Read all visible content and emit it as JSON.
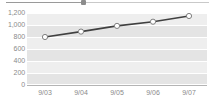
{
  "widget": {
    "title": "",
    "top_slider": {
      "name": "horizontal-scrollbar",
      "thumb_position_pct": 38
    }
  },
  "colors": {
    "plot_background": "#eeeeee",
    "band": "#e4e4e4",
    "gridline": "#ffffff",
    "axis": "#b4b4b4",
    "tick_label": "#8a8a8a",
    "series_line": "#404040",
    "marker_fill": "#ffffff",
    "marker_stroke": "#808080"
  },
  "chart_data": {
    "type": "line",
    "title": "",
    "subtitle": "",
    "xlabel": "",
    "ylabel": "",
    "categories": [
      "9/03",
      "9/04",
      "9/05",
      "9/06",
      "9/07"
    ],
    "series": [
      {
        "name": "Series 1",
        "values": [
          800,
          890,
          985,
          1055,
          1150
        ]
      }
    ],
    "ylim": [
      0,
      1200
    ],
    "ytick_step": 200,
    "ytick_labels": [
      "1,200",
      "1,000",
      "800",
      "600",
      "400",
      "200",
      "0"
    ],
    "ytick_values": [
      1200,
      1000,
      800,
      600,
      400,
      200,
      0
    ],
    "xtick_labels": [
      "9/03",
      "9/04",
      "9/05",
      "9/06",
      "9/07"
    ],
    "grid": true,
    "grid_orientation": "horizontal",
    "legend": false,
    "legend_position": "none",
    "markers": true,
    "marker_shape": "circle"
  }
}
